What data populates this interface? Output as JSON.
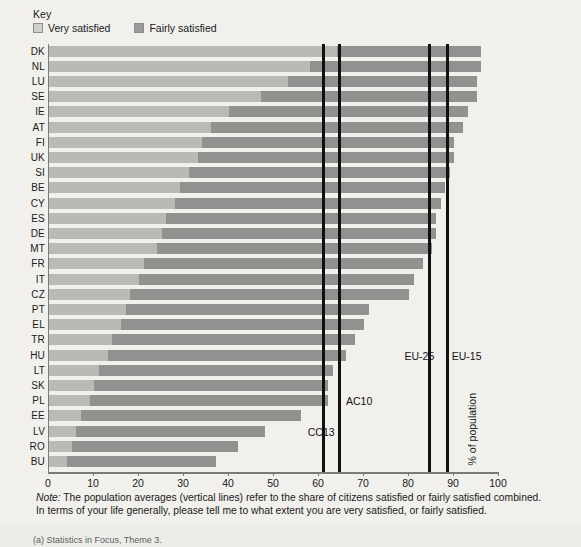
{
  "legend": {
    "title": "Key",
    "items": [
      {
        "label": "Very satisfied",
        "color": "#cfcfcb",
        "key": "very"
      },
      {
        "label": "Fairly satisfied",
        "color": "#9a9a98",
        "key": "fairly"
      }
    ]
  },
  "axis": {
    "y_title": "% of population",
    "x_ticks": [
      "0",
      "10",
      "20",
      "30",
      "40",
      "50",
      "60",
      "70",
      "80",
      "90",
      "100"
    ]
  },
  "note": {
    "prefix": "Note:",
    "line1": " The population averages (vertical lines) refer to the share of citizens satisfied or fairly satisfied combined.",
    "line2": "In terms of your life generally, please tell me to what extent you are very satisfied, or fairly satisfied."
  },
  "footer": {
    "text": "(a) Statistics in Focus, Theme 3."
  },
  "chart_data": {
    "type": "bar",
    "orientation": "horizontal",
    "stacked": true,
    "title": "",
    "xlabel": "% of population",
    "ylabel": "",
    "xlim": [
      0,
      100
    ],
    "grid": false,
    "legend_position": "top-left",
    "categories": [
      "DK",
      "NL",
      "LU",
      "SE",
      "IE",
      "AT",
      "FI",
      "UK",
      "SI",
      "BE",
      "CY",
      "ES",
      "DE",
      "MT",
      "FR",
      "IT",
      "CZ",
      "PT",
      "EL",
      "TR",
      "HU",
      "LT",
      "SK",
      "PL",
      "EE",
      "LV",
      "RO",
      "BU"
    ],
    "series": [
      {
        "name": "Very satisfied",
        "color": "#b9b9b6",
        "values": [
          64,
          58,
          53,
          47,
          40,
          36,
          34,
          33,
          31,
          29,
          28,
          26,
          25,
          24,
          21,
          20,
          18,
          17,
          16,
          14,
          13,
          11,
          10,
          9,
          7,
          6,
          5,
          4
        ]
      },
      {
        "name": "Fairly satisfied",
        "color": "#919190",
        "values": [
          32,
          38,
          42,
          48,
          53,
          56,
          56,
          57,
          58,
          59,
          59,
          60,
          61,
          61,
          62,
          61,
          62,
          54,
          54,
          54,
          53,
          52,
          52,
          53,
          49,
          42,
          37,
          33
        ]
      }
    ],
    "totals": [
      96,
      96,
      95,
      95,
      93,
      92,
      90,
      90,
      89,
      88,
      87,
      86,
      86,
      85,
      83,
      81,
      80,
      71,
      70,
      68,
      66,
      63,
      62,
      62,
      56,
      48,
      42,
      37
    ],
    "average_lines": [
      {
        "label": "CC13",
        "value": 61.0,
        "label_x": 57.5,
        "label_y_row": 25
      },
      {
        "label": "AC10",
        "value": 64.5,
        "label_x": 66.0,
        "label_y_row": 23
      },
      {
        "label": "EU-25",
        "value": 84.5,
        "label_x": 79.0,
        "label_y_row": 20
      },
      {
        "label": "EU-15",
        "value": 88.5,
        "label_x": 89.5,
        "label_y_row": 20
      }
    ]
  }
}
